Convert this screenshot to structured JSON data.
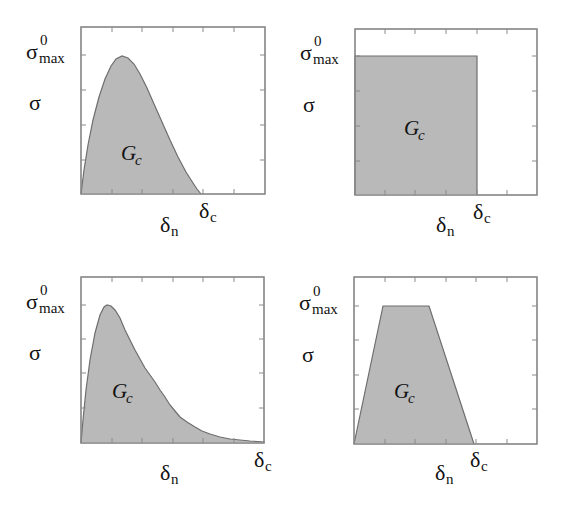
{
  "colors": {
    "fill": "#b9b9b9",
    "curve": "#6e6e6e",
    "frame": "#8a8a8a",
    "tick": "#8a8a8a",
    "background": "#ffffff"
  },
  "labels": {
    "sigma": "σ",
    "sigma_max_base": "σ",
    "sigma_max_sup": "0",
    "sigma_max_sub": "max",
    "gc_base": "G",
    "gc_sub": "c",
    "delta_n_base": "δ",
    "delta_n_sub": "n",
    "delta_c_base": "δ",
    "delta_c_sub": "c"
  },
  "panels": [
    {
      "id": "exponential-law",
      "box": [
        81,
        27,
        265,
        194
      ],
      "shape": "path",
      "points": [
        [
          81,
          194
        ],
        [
          84,
          170
        ],
        [
          88,
          145
        ],
        [
          93,
          120
        ],
        [
          99,
          97
        ],
        [
          105,
          79
        ],
        [
          111,
          66
        ],
        [
          116,
          59
        ],
        [
          122,
          56
        ],
        [
          128,
          58
        ],
        [
          134,
          64
        ],
        [
          140,
          74
        ],
        [
          147,
          88
        ],
        [
          154,
          104
        ],
        [
          162,
          122
        ],
        [
          170,
          140
        ],
        [
          178,
          157
        ],
        [
          186,
          172
        ],
        [
          193,
          183
        ],
        [
          197,
          189
        ],
        [
          201,
          194
        ]
      ],
      "xticks": [
        112,
        142,
        173,
        203,
        234
      ],
      "yticks": [
        55,
        90,
        125,
        160
      ],
      "sigma_max_y": 55,
      "sigma_y": 103,
      "gc_pos": [
        121,
        160
      ],
      "delta_n_x": 168,
      "delta_n_y": 232,
      "delta_c_x": 203,
      "delta_c_y": 218
    },
    {
      "id": "constant-law",
      "box": [
        355,
        29,
        537,
        195
      ],
      "shape": "path",
      "points": [
        [
          355,
          195
        ],
        [
          355,
          56
        ],
        [
          477,
          56
        ],
        [
          477,
          195
        ]
      ],
      "xticks": [
        385,
        415,
        446,
        477,
        507
      ],
      "yticks": [
        56,
        91,
        126,
        161
      ],
      "sigma_max_y": 56,
      "sigma_y": 105,
      "gc_pos": [
        404,
        135
      ],
      "delta_n_x": 444,
      "delta_n_y": 232,
      "delta_c_x": 477,
      "delta_c_y": 219
    },
    {
      "id": "skewed-exponential-law",
      "box": [
        81,
        277,
        264,
        443
      ],
      "shape": "path",
      "points": [
        [
          81,
          443
        ],
        [
          83,
          420
        ],
        [
          86,
          390
        ],
        [
          90,
          360
        ],
        [
          95,
          333
        ],
        [
          100,
          315
        ],
        [
          104,
          307
        ],
        [
          107,
          305
        ],
        [
          111,
          306
        ],
        [
          115,
          310
        ],
        [
          120,
          318
        ],
        [
          125,
          330
        ],
        [
          130,
          340
        ],
        [
          135,
          350
        ],
        [
          140,
          359
        ],
        [
          145,
          368
        ],
        [
          150,
          375
        ],
        [
          155,
          382
        ],
        [
          160,
          390
        ],
        [
          165,
          397
        ],
        [
          170,
          405
        ],
        [
          175,
          411
        ],
        [
          180,
          417
        ],
        [
          187,
          422
        ],
        [
          195,
          427
        ],
        [
          202,
          431
        ],
        [
          210,
          434
        ],
        [
          220,
          437
        ],
        [
          230,
          439
        ],
        [
          240,
          440
        ],
        [
          250,
          441
        ],
        [
          264,
          442
        ],
        [
          264,
          443
        ]
      ],
      "xticks": [
        112,
        142,
        173,
        203,
        234
      ],
      "yticks": [
        305,
        339,
        373,
        408
      ],
      "sigma_max_y": 305,
      "sigma_y": 353,
      "gc_pos": [
        112,
        398
      ],
      "delta_n_x": 168,
      "delta_n_y": 480,
      "delta_c_x": 258,
      "delta_c_y": 467
    },
    {
      "id": "trapezoidal-law",
      "box": [
        354,
        277,
        537,
        444
      ],
      "shape": "path",
      "points": [
        [
          354,
          444
        ],
        [
          383,
          306
        ],
        [
          429,
          306
        ],
        [
          474,
          444
        ]
      ],
      "xticks": [
        385,
        415,
        446,
        476,
        507
      ],
      "yticks": [
        306,
        340,
        375,
        409
      ],
      "sigma_max_y": 306,
      "sigma_y": 355,
      "gc_pos": [
        394,
        398
      ],
      "delta_n_x": 443,
      "delta_n_y": 480,
      "delta_c_x": 474,
      "delta_c_y": 467
    }
  ]
}
